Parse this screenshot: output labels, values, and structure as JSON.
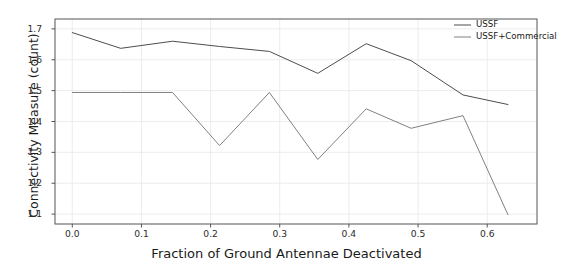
{
  "chart_data": {
    "type": "line",
    "title": "",
    "xlabel": "Fraction of Ground Antennae Deactivated",
    "ylabel": "Connectivity Measure (count)",
    "xlim": [
      -0.025,
      0.672
    ],
    "ylim": [
      1.068,
      1.732
    ],
    "xticks": [
      "0.0",
      "0.1",
      "0.2",
      "0.3",
      "0.4",
      "0.5",
      "0.6"
    ],
    "xtick_values": [
      0.0,
      0.1,
      0.2,
      0.3,
      0.4,
      0.5,
      0.6
    ],
    "yticks": [
      "1.1",
      "1.2",
      "1.3",
      "1.4",
      "1.5",
      "1.6",
      "1.7"
    ],
    "ytick_values": [
      1.1,
      1.2,
      1.3,
      1.4,
      1.5,
      1.6,
      1.7
    ],
    "grid": true,
    "grid_color": "#eaeaea",
    "legend_position": "upper right",
    "series": [
      {
        "name": "USSF",
        "color": "#4d4d4d",
        "x": [
          0.0,
          0.07,
          0.145,
          0.213,
          0.285,
          0.355,
          0.425,
          0.49,
          0.565,
          0.63
        ],
        "y": [
          1.688,
          1.637,
          1.66,
          1.643,
          1.627,
          1.556,
          1.652,
          1.597,
          1.486,
          1.455
        ]
      },
      {
        "name": "USSF+Commercial",
        "color": "#808080",
        "x": [
          0.0,
          0.07,
          0.145,
          0.213,
          0.285,
          0.355,
          0.425,
          0.49,
          0.565,
          0.63
        ],
        "y": [
          1.494,
          1.494,
          1.494,
          1.322,
          1.494,
          1.277,
          1.441,
          1.378,
          1.419,
          1.098
        ]
      }
    ]
  },
  "legend": {
    "entries": [
      {
        "label": "USSF",
        "color": "#4d4d4d"
      },
      {
        "label": "USSF+Commercial",
        "color": "#808080"
      }
    ]
  }
}
